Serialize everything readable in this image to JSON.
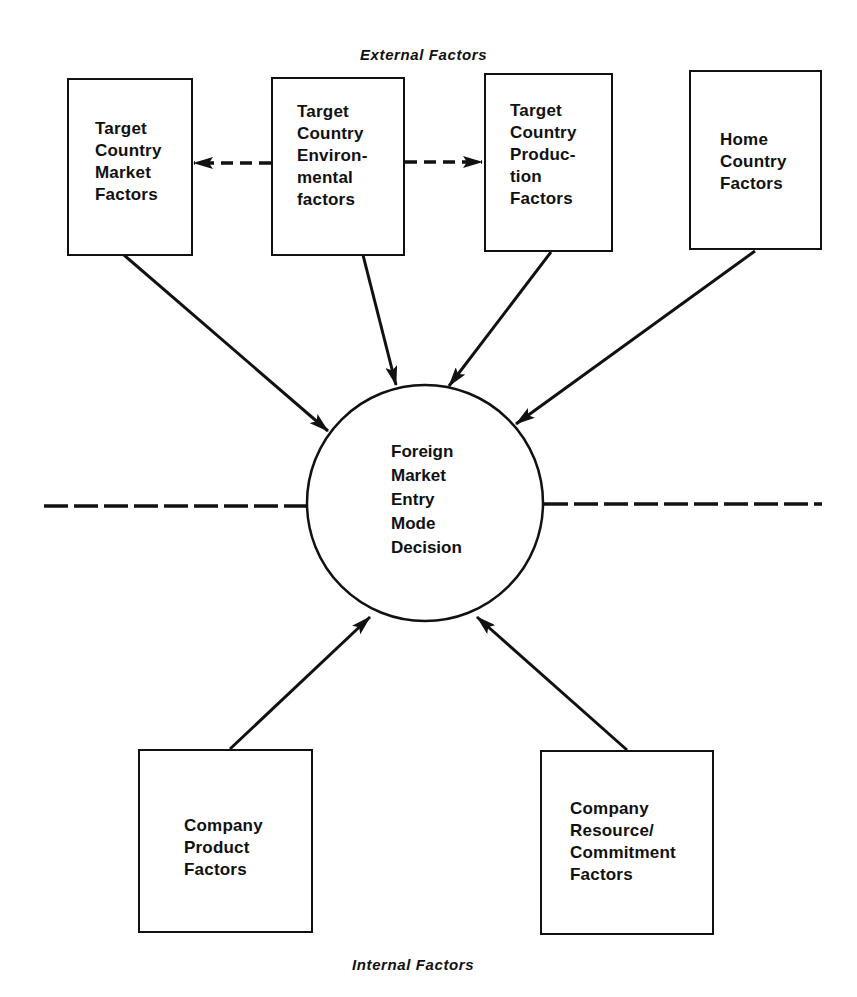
{
  "diagram": {
    "section_labels": {
      "external": "External Factors",
      "internal": "Internal Factors"
    },
    "center": {
      "lines": [
        "Foreign",
        "Market",
        "Entry",
        "Mode",
        "Decision"
      ]
    },
    "external_factors": [
      {
        "id": "target-market",
        "lines": [
          "Target",
          "Country",
          "Market",
          "Factors"
        ]
      },
      {
        "id": "target-environmental",
        "lines": [
          "Target",
          "Country",
          "Environ-",
          "mental",
          "factors"
        ]
      },
      {
        "id": "target-production",
        "lines": [
          "Target",
          "Country",
          "Produc-",
          "tion",
          "Factors"
        ]
      },
      {
        "id": "home-country",
        "lines": [
          "Home",
          "Country",
          "Factors"
        ]
      }
    ],
    "internal_factors": [
      {
        "id": "company-product",
        "lines": [
          "Company",
          "Product",
          "Factors"
        ]
      },
      {
        "id": "company-resource",
        "lines": [
          "Company",
          "Resource/",
          "Commitment",
          "Factors"
        ]
      }
    ],
    "edges": [
      {
        "from": "target-environmental",
        "to": "target-market",
        "style": "dashed"
      },
      {
        "from": "target-environmental",
        "to": "target-production",
        "style": "dashed"
      },
      {
        "from": "target-market",
        "to": "center",
        "style": "solid"
      },
      {
        "from": "target-environmental",
        "to": "center",
        "style": "solid"
      },
      {
        "from": "target-production",
        "to": "center",
        "style": "solid"
      },
      {
        "from": "home-country",
        "to": "center",
        "style": "solid"
      },
      {
        "from": "company-product",
        "to": "center",
        "style": "solid"
      },
      {
        "from": "company-resource",
        "to": "center",
        "style": "solid"
      }
    ],
    "colors": {
      "ink": "#111111",
      "background": "#ffffff"
    }
  }
}
